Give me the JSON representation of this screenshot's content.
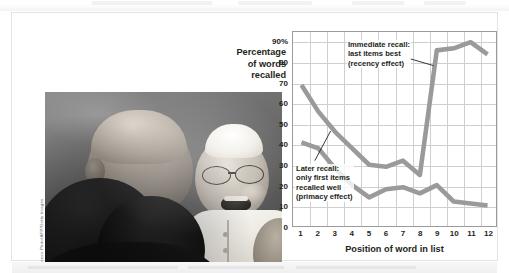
{
  "figure": {
    "photo_credit": "Vincenzo Pinto/AFP/Getty Images",
    "photo_alt": "Pope Francis laughing while greeting people in a crowd"
  },
  "chart_data": {
    "type": "line",
    "title": "",
    "xlabel": "Position of word in list",
    "ylabel": "Percentage of words recalled",
    "x": [
      1,
      2,
      3,
      4,
      5,
      6,
      7,
      8,
      9,
      10,
      11,
      12
    ],
    "xtick_labels": [
      "1",
      "2",
      "3",
      "4",
      "5",
      "6",
      "7",
      "8",
      "9",
      "10",
      "11",
      "12"
    ],
    "ytick_labels": [
      "90%",
      "80",
      "70",
      "60",
      "50",
      "40",
      "30",
      "20",
      "10",
      "0"
    ],
    "ytick_values": [
      90,
      80,
      70,
      60,
      50,
      40,
      30,
      20,
      10,
      0
    ],
    "ylim": [
      0,
      95
    ],
    "grid": true,
    "legend": "none",
    "line_color": "#9a9a9a",
    "axis_color": "#9b9b9b",
    "grid_color": "#cfcfcf",
    "text_color": "#231f20",
    "series": [
      {
        "name": "Immediate recall",
        "values": [
          69,
          56,
          46,
          38,
          30,
          29,
          32,
          25,
          86,
          87,
          90,
          84
        ]
      },
      {
        "name": "Later recall",
        "values": [
          41,
          38,
          28,
          20,
          14,
          18,
          19,
          16,
          20,
          12,
          11,
          10
        ]
      }
    ],
    "annotations": [
      {
        "name": "immediate-recall-annotation",
        "lines": [
          "Immediate recall:",
          "last items best",
          "(recency effect)"
        ],
        "points_to_x": 9
      },
      {
        "name": "later-recall-annotation",
        "lines": [
          "Later recall:",
          "only first items",
          "recalled well",
          "(primacy effect)"
        ],
        "points_to_x": 2
      }
    ]
  }
}
